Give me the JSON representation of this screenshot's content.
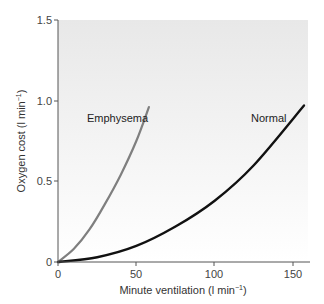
{
  "chart_data": {
    "type": "line",
    "title": "",
    "xlabel": "Minute ventilation (l min⁻¹)",
    "ylabel": "Oxygen cost (l min⁻¹)",
    "xlim": [
      0,
      160
    ],
    "ylim": [
      0,
      1.5
    ],
    "x_ticks": [
      "0",
      "50",
      "100",
      "150"
    ],
    "y_ticks": [
      "0",
      "0.5",
      "1.0",
      "1.5"
    ],
    "grid": false,
    "legend": "none (inline labels)",
    "series": [
      {
        "name": "Emphysema",
        "color": "#7f7f7f",
        "x": [
          0,
          10,
          20,
          30,
          40,
          50,
          58
        ],
        "y": [
          0,
          0.08,
          0.2,
          0.36,
          0.54,
          0.75,
          0.96
        ]
      },
      {
        "name": "Normal",
        "color": "#111111",
        "x": [
          0,
          25,
          50,
          75,
          100,
          125,
          157
        ],
        "y": [
          0,
          0.03,
          0.1,
          0.22,
          0.38,
          0.6,
          0.97
        ]
      }
    ],
    "annotations": [
      {
        "text": "Emphysema",
        "near_series": "Emphysema"
      },
      {
        "text": "Normal",
        "near_series": "Normal"
      }
    ]
  },
  "axes": {
    "x_title_main": "Minute ventilation (l min",
    "x_title_sup": "−1",
    "x_title_end": ")",
    "y_title_main": "Oxygen cost (l min",
    "y_title_sup": "−1",
    "y_title_end": ")"
  },
  "colors": {
    "plot_bg_top": "#e9e9e9",
    "plot_bg_bottom": "#ffffff",
    "axis": "#555555",
    "emphysema": "#7f7f7f",
    "normal": "#111111"
  }
}
